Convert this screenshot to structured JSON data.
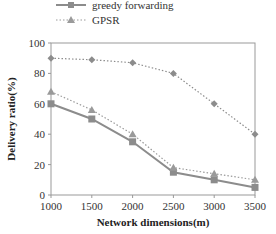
{
  "chart_data": {
    "type": "line",
    "title": "",
    "xlabel": "Network dimensions(m)",
    "ylabel": "Delivery ratio(%)",
    "x": [
      1000,
      1500,
      2000,
      2500,
      3000,
      3500
    ],
    "xticks": [
      "1000",
      "1500",
      "2000",
      "2500",
      "3000",
      "3500"
    ],
    "yticks": [
      "0",
      "20",
      "40",
      "60",
      "80",
      "100"
    ],
    "ylim": [
      0,
      100
    ],
    "xlim": [
      1000,
      3500
    ],
    "grid": false,
    "legend_position": "top-center (outside plot)",
    "series": [
      {
        "name": "greedy forwarding",
        "marker": "square",
        "line": "solid",
        "color": "#8c8c8c",
        "values": [
          60,
          50,
          35,
          15,
          10,
          5
        ]
      },
      {
        "name": "GPSR",
        "marker": "triangle",
        "line": "dotted",
        "color": "#9a9a9a",
        "values": [
          68,
          56,
          40,
          18,
          14,
          10
        ]
      },
      {
        "name": "",
        "marker": "diamond",
        "line": "dotted",
        "color": "#8c8c8c",
        "values": [
          90,
          89,
          87,
          80,
          60,
          40
        ]
      }
    ]
  },
  "legend": {
    "items": [
      {
        "label": "greedy forwarding"
      },
      {
        "label": "GPSR"
      }
    ]
  }
}
